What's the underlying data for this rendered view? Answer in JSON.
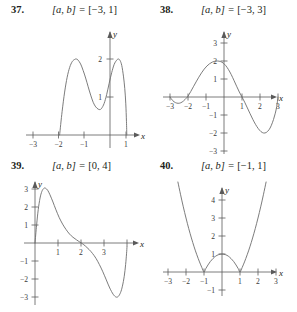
{
  "page": {
    "background": "#ffffff",
    "curve_color": "#6d6d6d",
    "axis_color": "#5a5a5a",
    "text_color": "#231f20"
  },
  "problems": [
    {
      "number": "37.",
      "interval_prefix": "[a, b] = ",
      "interval_value": "[−3, 1]",
      "x_axis_label": "x",
      "y_axis_label": "y",
      "x_ticks": [
        "−3",
        "−2",
        "−1",
        "1"
      ],
      "y_ticks": [
        "1",
        "2"
      ],
      "chart_data": {
        "type": "line",
        "title": "Problem 37 graph",
        "xlabel": "x",
        "ylabel": "y",
        "xlim": [
          -3.4,
          1.4
        ],
        "ylim": [
          -0.35,
          2.45
        ],
        "grid": false,
        "legend": "none",
        "xticks": [
          -3,
          -2,
          -1,
          1
        ],
        "yticks": [
          1,
          2
        ],
        "description": "W-shaped curve with two maxima near 2 and a local minimum near 0.7; touches x-axis at x = -3 and x = 1",
        "points": [
          [
            -3.0,
            0.0
          ],
          [
            -2.85,
            0.62
          ],
          [
            -2.7,
            1.13
          ],
          [
            -2.55,
            1.52
          ],
          [
            -2.4,
            1.78
          ],
          [
            -2.25,
            1.93
          ],
          [
            -2.1,
            1.99
          ],
          [
            -2.0,
            2.0
          ],
          [
            -1.9,
            1.97
          ],
          [
            -1.75,
            1.87
          ],
          [
            -1.6,
            1.7
          ],
          [
            -1.45,
            1.5
          ],
          [
            -1.3,
            1.27
          ],
          [
            -1.15,
            1.05
          ],
          [
            -1.0,
            0.86
          ],
          [
            -0.85,
            0.74
          ],
          [
            -0.7,
            0.68
          ],
          [
            -0.6,
            0.67
          ],
          [
            -0.5,
            0.7
          ],
          [
            -0.35,
            0.83
          ],
          [
            -0.2,
            1.06
          ],
          [
            -0.05,
            1.36
          ],
          [
            0.1,
            1.64
          ],
          [
            0.25,
            1.86
          ],
          [
            0.4,
            1.97
          ],
          [
            0.5,
            2.0
          ],
          [
            0.6,
            1.96
          ],
          [
            0.7,
            1.83
          ],
          [
            0.8,
            1.55
          ],
          [
            0.88,
            1.22
          ],
          [
            0.94,
            0.82
          ],
          [
            0.98,
            0.36
          ],
          [
            1.0,
            0.0
          ]
        ]
      }
    },
    {
      "number": "38.",
      "interval_prefix": "[a, b] = ",
      "interval_value": "[−3, 3]",
      "x_axis_label": "x",
      "y_axis_label": "y",
      "x_ticks": [
        "−3",
        "−2",
        "−1",
        "1",
        "2",
        "3"
      ],
      "y_ticks": [
        "1",
        "2",
        "3",
        "−1",
        "−2",
        "−3"
      ],
      "chart_data": {
        "type": "line",
        "title": "Problem 38 graph",
        "xlabel": "x",
        "ylabel": "y",
        "xlim": [
          -3.5,
          3.6
        ],
        "ylim": [
          -3.4,
          3.4
        ],
        "grid": false,
        "legend": "none",
        "xticks": [
          -3,
          -2,
          -1,
          1,
          2,
          3
        ],
        "yticks": [
          -3,
          -2,
          -1,
          1,
          2,
          3
        ],
        "description": "Wave with small dip below axis between x=-3 and x=-2, maximum about 2 near x=-0.3, zero at x=1, minimum about -2 near x=2.2, rising back to zero at x=3",
        "points": [
          [
            -3.0,
            0.0
          ],
          [
            -2.85,
            -0.2
          ],
          [
            -2.7,
            -0.31
          ],
          [
            -2.55,
            -0.35
          ],
          [
            -2.4,
            -0.32
          ],
          [
            -2.25,
            -0.22
          ],
          [
            -2.1,
            -0.07
          ],
          [
            -2.0,
            0.05
          ],
          [
            -1.85,
            0.3
          ],
          [
            -1.7,
            0.57
          ],
          [
            -1.55,
            0.84
          ],
          [
            -1.4,
            1.1
          ],
          [
            -1.25,
            1.34
          ],
          [
            -1.1,
            1.55
          ],
          [
            -0.95,
            1.72
          ],
          [
            -0.8,
            1.85
          ],
          [
            -0.65,
            1.94
          ],
          [
            -0.5,
            1.99
          ],
          [
            -0.35,
            2.0
          ],
          [
            -0.2,
            1.97
          ],
          [
            -0.05,
            1.89
          ],
          [
            0.1,
            1.74
          ],
          [
            0.25,
            1.52
          ],
          [
            0.4,
            1.25
          ],
          [
            0.55,
            0.93
          ],
          [
            0.7,
            0.6
          ],
          [
            0.85,
            0.28
          ],
          [
            1.0,
            0.0
          ],
          [
            1.15,
            -0.29
          ],
          [
            1.3,
            -0.61
          ],
          [
            1.45,
            -0.93
          ],
          [
            1.6,
            -1.24
          ],
          [
            1.75,
            -1.52
          ],
          [
            1.9,
            -1.75
          ],
          [
            2.05,
            -1.92
          ],
          [
            2.2,
            -2.0
          ],
          [
            2.35,
            -1.97
          ],
          [
            2.5,
            -1.82
          ],
          [
            2.62,
            -1.6
          ],
          [
            2.75,
            -1.25
          ],
          [
            2.85,
            -0.9
          ],
          [
            2.93,
            -0.52
          ],
          [
            3.0,
            0.0
          ]
        ]
      }
    },
    {
      "number": "39.",
      "interval_prefix": "[a, b] = ",
      "interval_value": "[0, 4]",
      "x_axis_label": "x",
      "y_axis_label": "y",
      "x_ticks": [
        "1",
        "2",
        "3"
      ],
      "y_ticks": [
        "1",
        "2",
        "3",
        "−1",
        "−2",
        "−3"
      ],
      "chart_data": {
        "type": "line",
        "title": "Problem 39 graph",
        "xlabel": "x",
        "ylabel": "y",
        "xlim": [
          -0.55,
          4.5
        ],
        "ylim": [
          -3.5,
          3.5
        ],
        "grid": false,
        "legend": "none",
        "xticks": [
          1,
          2,
          3
        ],
        "yticks": [
          -3,
          -2,
          -1,
          1,
          2,
          3
        ],
        "description": "Starts at origin, rises steeply to about 3 near x=0.45, decays through zero near x=2, dips to about -3 near x=3.5, then rises sharply at x=4",
        "points": [
          [
            0.0,
            0.0
          ],
          [
            0.07,
            1.0
          ],
          [
            0.14,
            1.85
          ],
          [
            0.22,
            2.5
          ],
          [
            0.3,
            2.87
          ],
          [
            0.38,
            3.03
          ],
          [
            0.45,
            3.05
          ],
          [
            0.55,
            2.93
          ],
          [
            0.65,
            2.68
          ],
          [
            0.78,
            2.28
          ],
          [
            0.9,
            1.88
          ],
          [
            1.05,
            1.42
          ],
          [
            1.2,
            1.05
          ],
          [
            1.35,
            0.75
          ],
          [
            1.5,
            0.5
          ],
          [
            1.65,
            0.32
          ],
          [
            1.8,
            0.18
          ],
          [
            1.95,
            0.05
          ],
          [
            2.05,
            -0.03
          ],
          [
            2.2,
            -0.18
          ],
          [
            2.35,
            -0.36
          ],
          [
            2.5,
            -0.58
          ],
          [
            2.65,
            -0.85
          ],
          [
            2.8,
            -1.2
          ],
          [
            2.95,
            -1.6
          ],
          [
            3.1,
            -2.05
          ],
          [
            3.25,
            -2.5
          ],
          [
            3.4,
            -2.85
          ],
          [
            3.52,
            -3.0
          ],
          [
            3.62,
            -2.97
          ],
          [
            3.72,
            -2.75
          ],
          [
            3.8,
            -2.4
          ],
          [
            3.88,
            -1.85
          ],
          [
            3.94,
            -1.2
          ],
          [
            3.98,
            -0.6
          ],
          [
            4.0,
            -0.2
          ]
        ]
      }
    },
    {
      "number": "40.",
      "interval_prefix": "[a, b] = ",
      "interval_value": "[−1, 1]",
      "x_axis_label": "x",
      "y_axis_label": "y",
      "x_ticks": [
        "−3",
        "−2",
        "−1",
        "1",
        "2",
        "3"
      ],
      "y_ticks": [
        "1",
        "2",
        "3",
        "4",
        "−1"
      ],
      "chart_data": {
        "type": "line",
        "title": "Problem 40 graph",
        "xlabel": "x",
        "ylabel": "y",
        "xlim": [
          -3.5,
          3.6
        ],
        "ylim": [
          -1.4,
          4.8
        ],
        "grid": false,
        "legend": "none",
        "xticks": [
          -3,
          -2,
          -1,
          1,
          2,
          3
        ],
        "yticks": [
          -1,
          1,
          2,
          3,
          4
        ],
        "description": "Absolute-value parabola: steep arms outside [-1,1] rising past 4, and an arch peaking at y=1 at x=0 between the zeros at x=-1 and x=1",
        "points": [
          [
            -2.45,
            5.0
          ],
          [
            -2.3,
            4.29
          ],
          [
            -2.15,
            3.62
          ],
          [
            -2.0,
            3.0
          ],
          [
            -1.85,
            2.42
          ],
          [
            -1.7,
            1.89
          ],
          [
            -1.55,
            1.4
          ],
          [
            -1.4,
            0.96
          ],
          [
            -1.25,
            0.56
          ],
          [
            -1.12,
            0.25
          ],
          [
            -1.0,
            0.0
          ],
          [
            -0.9,
            0.19
          ],
          [
            -0.78,
            0.39
          ],
          [
            -0.65,
            0.58
          ],
          [
            -0.5,
            0.75
          ],
          [
            -0.35,
            0.88
          ],
          [
            -0.2,
            0.96
          ],
          [
            0.0,
            1.0
          ],
          [
            0.2,
            0.96
          ],
          [
            0.35,
            0.88
          ],
          [
            0.5,
            0.75
          ],
          [
            0.65,
            0.58
          ],
          [
            0.78,
            0.39
          ],
          [
            0.9,
            0.19
          ],
          [
            1.0,
            0.0
          ],
          [
            1.12,
            0.25
          ],
          [
            1.25,
            0.56
          ],
          [
            1.4,
            0.96
          ],
          [
            1.55,
            1.4
          ],
          [
            1.7,
            1.89
          ],
          [
            1.85,
            2.42
          ],
          [
            2.0,
            3.0
          ],
          [
            2.15,
            3.62
          ],
          [
            2.3,
            4.29
          ],
          [
            2.45,
            5.0
          ]
        ]
      }
    }
  ]
}
